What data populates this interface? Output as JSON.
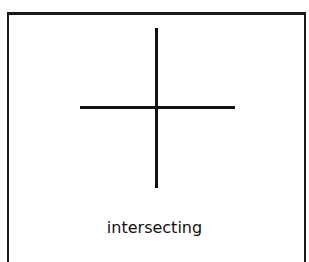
{
  "diagram": {
    "label": "intersecting",
    "shapes": [
      {
        "type": "line",
        "orientation": "vertical"
      },
      {
        "type": "line",
        "orientation": "horizontal"
      }
    ]
  }
}
